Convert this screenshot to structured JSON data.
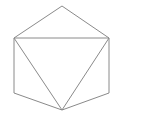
{
  "figure": {
    "kind": "geometry-line-drawing",
    "canvas": {
      "width": 146,
      "height": 124,
      "background_color": "#ffffff"
    },
    "stroke": {
      "color": "#8a8a8a",
      "width": 1
    },
    "vertices": {
      "top": [
        62,
        6
      ],
      "top_right": [
        109,
        38
      ],
      "bottom_right": [
        109,
        93
      ],
      "bottom": [
        62,
        110
      ],
      "bottom_left": [
        14,
        93
      ],
      "top_left": [
        14,
        38
      ]
    },
    "hexagon": {
      "name": "outer-hexagon",
      "points": "62,6 109,38 109,93 62,110 14,93 14,38",
      "closed": true
    },
    "triangle": {
      "name": "inscribed-triangle",
      "points": "14,38 109,38 62,110",
      "closed": true
    },
    "labels": []
  }
}
